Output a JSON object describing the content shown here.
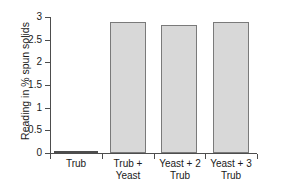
{
  "chart_data": {
    "type": "bar",
    "title": "",
    "xlabel": "",
    "ylabel": "Reading in % spun solids",
    "categories": [
      "Trub",
      "Trub +\nYeast",
      "Yeast + 2\nTrub",
      "Yeast + 3\nTrub"
    ],
    "values": [
      0.02,
      2.89,
      2.82,
      2.88
    ],
    "ylim": [
      0,
      3
    ],
    "ytick_values": [
      0,
      0.5,
      1,
      1.5,
      2,
      2.5,
      3
    ],
    "ytick_labels": [
      "0",
      "0.5",
      "1",
      "1.5",
      "2",
      "2.5",
      "3"
    ],
    "grid": false,
    "legend": null,
    "bar_fill_color": "#d8d8d8",
    "bar_edge_color": "#7a7a7a",
    "axis_color": "#4d4d4d",
    "background_color": "#ffffff"
  },
  "axes": {
    "y_title": "Reading in % spun solids"
  }
}
